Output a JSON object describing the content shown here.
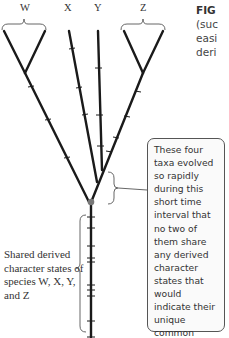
{
  "taxa_labels": {
    "w": "W",
    "x": "X",
    "y": "Y",
    "z": "Z"
  },
  "caption_fragment": {
    "title": "FIG",
    "line1": "(suc",
    "line2": "easi",
    "line3": "deri"
  },
  "callout_text": "These four taxa evolved so rapidly during this short time interval that no two of them share any derived character states that would indicate their unique common ancestry.",
  "shared_label": "Shared derived character states of species W, X, Y, and Z",
  "colors": {
    "branch": "#1a1a1a",
    "node": "#777777",
    "brace": "#555555"
  }
}
